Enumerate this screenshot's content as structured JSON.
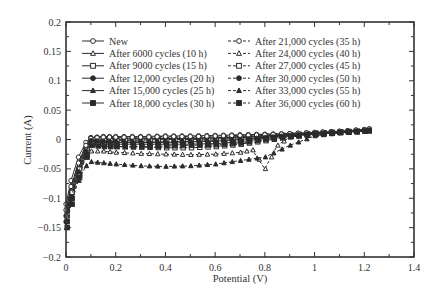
{
  "chart_data": {
    "type": "line",
    "title": "",
    "xlabel": "Potential (V)",
    "ylabel": "Current (A)",
    "xlim": [
      0,
      1.4
    ],
    "ylim": [
      -0.2,
      0.2
    ],
    "xticks": [
      0,
      0.2,
      0.4,
      0.6,
      0.8,
      1,
      1.2,
      1.4
    ],
    "xtick_labels": [
      "0",
      "0.2",
      "0.4",
      "0.6",
      "0.8",
      "1",
      "1.2",
      "1.4"
    ],
    "yticks": [
      -0.2,
      -0.15,
      -0.1,
      -0.05,
      0,
      0.05,
      0.1,
      0.15,
      0.2
    ],
    "ytick_labels": [
      "−0.2",
      "−0.15",
      "−0.1",
      "−0.05",
      "0",
      "0.05",
      "0.1",
      "0.15",
      "0.2"
    ],
    "grid": false,
    "legend_position": "upper left, two columns",
    "series": [
      {
        "name": "New",
        "marker": "circle-open",
        "dash": false,
        "x": [
          0.0,
          0.02,
          0.05,
          0.08,
          0.1,
          0.15,
          0.2,
          0.3,
          0.4,
          0.5,
          0.6,
          0.7,
          0.8,
          0.9,
          1.0,
          1.1,
          1.2,
          1.22
        ],
        "y": [
          -0.11,
          -0.07,
          -0.03,
          -0.005,
          0.003,
          0.005,
          0.005,
          0.005,
          0.006,
          0.006,
          0.007,
          0.008,
          0.009,
          0.01,
          0.012,
          0.014,
          0.017,
          0.018
        ]
      },
      {
        "name": "After 6000 cycles (10 h)",
        "marker": "triangle-open",
        "dash": false,
        "x": [
          0.0,
          0.02,
          0.05,
          0.08,
          0.1,
          0.15,
          0.2,
          0.3,
          0.4,
          0.5,
          0.6,
          0.7,
          0.8,
          0.9,
          1.0,
          1.1,
          1.2,
          1.22
        ],
        "y": [
          -0.12,
          -0.08,
          -0.04,
          -0.01,
          -0.002,
          0.0,
          0.0,
          0.001,
          0.002,
          0.002,
          0.003,
          0.005,
          0.007,
          0.009,
          0.011,
          0.013,
          0.016,
          0.017
        ]
      },
      {
        "name": "After 9000 cycles (15 h)",
        "marker": "square-open",
        "dash": false,
        "x": [
          0.0,
          0.02,
          0.05,
          0.08,
          0.1,
          0.15,
          0.2,
          0.3,
          0.4,
          0.5,
          0.6,
          0.7,
          0.8,
          0.9,
          1.0,
          1.1,
          1.2,
          1.22
        ],
        "y": [
          -0.12,
          -0.085,
          -0.045,
          -0.012,
          -0.004,
          -0.002,
          -0.002,
          -0.001,
          0.0,
          0.0,
          0.001,
          0.003,
          0.006,
          0.008,
          0.011,
          0.013,
          0.015,
          0.016
        ]
      },
      {
        "name": "After 12,000 cycles (20 h)",
        "marker": "circle-filled",
        "dash": false,
        "x": [
          0.0,
          0.02,
          0.05,
          0.08,
          0.1,
          0.15,
          0.2,
          0.3,
          0.4,
          0.5,
          0.6,
          0.7,
          0.8,
          0.9,
          1.0,
          1.1,
          1.2,
          1.22
        ],
        "y": [
          -0.13,
          -0.09,
          -0.05,
          -0.015,
          0.003,
          0.004,
          0.003,
          0.002,
          0.002,
          0.002,
          0.003,
          0.004,
          0.006,
          0.008,
          0.01,
          0.012,
          0.015,
          0.016
        ]
      },
      {
        "name": "After 15,000 cycles (25 h)",
        "marker": "triangle-filled",
        "dash": false,
        "x": [
          0.0,
          0.02,
          0.05,
          0.08,
          0.1,
          0.15,
          0.2,
          0.3,
          0.4,
          0.5,
          0.6,
          0.7,
          0.8,
          0.9,
          1.0,
          1.1,
          1.2,
          1.22
        ],
        "y": [
          -0.13,
          -0.095,
          -0.055,
          -0.02,
          -0.003,
          -0.004,
          -0.005,
          -0.005,
          -0.005,
          -0.004,
          -0.003,
          0.0,
          0.004,
          0.007,
          0.01,
          0.012,
          0.015,
          0.016
        ]
      },
      {
        "name": "After 18,000 cycles (30 h)",
        "marker": "square-filled",
        "dash": false,
        "x": [
          0.0,
          0.02,
          0.05,
          0.08,
          0.1,
          0.15,
          0.2,
          0.3,
          0.4,
          0.5,
          0.6,
          0.7,
          0.8,
          0.9,
          1.0,
          1.1,
          1.2,
          1.22
        ],
        "y": [
          -0.14,
          -0.1,
          -0.06,
          -0.025,
          -0.005,
          -0.008,
          -0.008,
          -0.008,
          -0.008,
          -0.008,
          -0.007,
          -0.004,
          0.002,
          0.006,
          0.009,
          0.012,
          0.014,
          0.015
        ]
      },
      {
        "name": "After 21,000 cycles (35 h)",
        "marker": "circle-open",
        "dash": true,
        "x": [
          0.0,
          0.02,
          0.05,
          0.08,
          0.1,
          0.15,
          0.2,
          0.3,
          0.4,
          0.5,
          0.6,
          0.7,
          0.8,
          0.9,
          1.0,
          1.1,
          1.2,
          1.22
        ],
        "y": [
          -0.12,
          -0.08,
          -0.04,
          -0.01,
          0.002,
          0.004,
          0.004,
          0.004,
          0.005,
          0.005,
          0.006,
          0.007,
          0.008,
          0.01,
          0.012,
          0.014,
          0.017,
          0.018
        ]
      },
      {
        "name": "After 24,000 cycles (40 h)",
        "marker": "triangle-open",
        "dash": true,
        "x": [
          0.0,
          0.02,
          0.05,
          0.08,
          0.1,
          0.15,
          0.2,
          0.3,
          0.4,
          0.5,
          0.6,
          0.7,
          0.75,
          0.8,
          0.85,
          0.9,
          1.0,
          1.1,
          1.2,
          1.22
        ],
        "y": [
          -0.13,
          -0.1,
          -0.06,
          -0.03,
          -0.02,
          -0.02,
          -0.022,
          -0.024,
          -0.025,
          -0.026,
          -0.025,
          -0.022,
          -0.018,
          -0.05,
          -0.01,
          0.004,
          0.009,
          0.012,
          0.014,
          0.015
        ]
      },
      {
        "name": "After 27,000 cycles (45 h)",
        "marker": "square-open",
        "dash": true,
        "x": [
          0.0,
          0.02,
          0.05,
          0.08,
          0.1,
          0.15,
          0.2,
          0.3,
          0.4,
          0.5,
          0.6,
          0.7,
          0.8,
          0.9,
          1.0,
          1.1,
          1.2,
          1.22
        ],
        "y": [
          -0.13,
          -0.09,
          -0.05,
          -0.018,
          -0.008,
          -0.01,
          -0.012,
          -0.013,
          -0.014,
          -0.014,
          -0.012,
          -0.008,
          -0.002,
          0.005,
          0.009,
          0.012,
          0.014,
          0.015
        ]
      },
      {
        "name": "After 30,000 cycles (50 h)",
        "marker": "circle-filled",
        "dash": true,
        "x": [
          0.0,
          0.02,
          0.05,
          0.08,
          0.1,
          0.15,
          0.2,
          0.3,
          0.4,
          0.5,
          0.6,
          0.7,
          0.8,
          0.9,
          1.0,
          1.1,
          1.2,
          1.22
        ],
        "y": [
          -0.14,
          -0.1,
          -0.055,
          -0.02,
          -0.002,
          -0.003,
          -0.004,
          -0.004,
          -0.004,
          -0.003,
          -0.002,
          0.0,
          0.003,
          0.007,
          0.01,
          0.012,
          0.015,
          0.016
        ]
      },
      {
        "name": "After 33,000 cycles (55 h)",
        "marker": "triangle-filled",
        "dash": true,
        "x": [
          0.0,
          0.02,
          0.05,
          0.08,
          0.1,
          0.15,
          0.2,
          0.3,
          0.4,
          0.5,
          0.6,
          0.7,
          0.8,
          0.9,
          1.0,
          1.1,
          1.2,
          1.22
        ],
        "y": [
          -0.15,
          -0.11,
          -0.07,
          -0.045,
          -0.038,
          -0.04,
          -0.042,
          -0.045,
          -0.046,
          -0.045,
          -0.042,
          -0.036,
          -0.03,
          -0.01,
          0.006,
          0.011,
          0.014,
          0.015
        ]
      },
      {
        "name": "After 36,000 cycles (60 h)",
        "marker": "square-filled",
        "dash": true,
        "x": [
          0.0,
          0.02,
          0.05,
          0.08,
          0.1,
          0.15,
          0.2,
          0.3,
          0.4,
          0.5,
          0.6,
          0.7,
          0.8,
          0.9,
          1.0,
          1.1,
          1.2,
          1.22
        ],
        "y": [
          -0.15,
          -0.11,
          -0.065,
          -0.03,
          -0.01,
          -0.012,
          -0.012,
          -0.012,
          -0.011,
          -0.01,
          -0.009,
          -0.006,
          0.0,
          0.005,
          0.009,
          0.012,
          0.014,
          0.015
        ]
      }
    ]
  },
  "legend": {
    "column1": [
      "New",
      "After 6000 cycles (10 h)",
      "After 9000 cycles (15 h)",
      "After 12,000 cycles (20 h)",
      "After 15,000 cycles (25 h)",
      "After 18,000 cycles (30 h)"
    ],
    "column2": [
      "After 21,000 cycles (35 h)",
      "After 24,000 cycles (40 h)",
      "After 27,000 cycles (45 h)",
      "After 30,000 cycles (50 h)",
      "After 33,000 cycles (55 h)",
      "After 36,000 cycles (60 h)"
    ]
  },
  "colors": {
    "axis": "#333333",
    "series": "#2b2b2b",
    "background": "#ffffff"
  }
}
